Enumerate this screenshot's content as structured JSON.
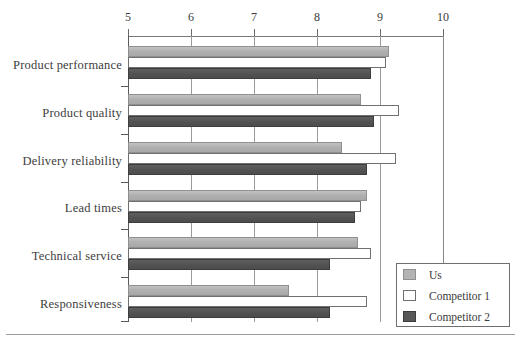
{
  "chart_data": {
    "type": "bar",
    "orientation": "horizontal",
    "title": "",
    "subtitle": "",
    "xlabel": "",
    "ylabel": "",
    "xlim": [
      5,
      10
    ],
    "xticks": [
      5,
      6,
      7,
      8,
      9,
      10
    ],
    "xtick_labels": [
      "5",
      "6",
      "7",
      "8",
      "9",
      "10"
    ],
    "grid": "vertical",
    "legend_position": "bottom-right",
    "categories": [
      "Product performance",
      "Product quality",
      "Delivery reliability",
      "Lead times",
      "Technical service",
      "Responsiveness"
    ],
    "series": [
      {
        "name": "Us",
        "color": "#b4b4b4",
        "values": [
          9.15,
          8.7,
          8.4,
          8.8,
          8.65,
          7.55
        ]
      },
      {
        "name": "Competitor 1",
        "color": "#ffffff",
        "values": [
          9.1,
          9.3,
          9.25,
          8.7,
          8.85,
          8.8
        ]
      },
      {
        "name": "Competitor 2",
        "color": "#585858",
        "values": [
          8.85,
          8.9,
          8.8,
          8.6,
          8.2,
          8.2
        ]
      }
    ]
  },
  "legend": {
    "items": [
      {
        "label": "Us",
        "swatch": "us"
      },
      {
        "label": "Competitor 1",
        "swatch": "c1"
      },
      {
        "label": "Competitor 2",
        "swatch": "c2"
      }
    ]
  },
  "axis": {
    "tick_labels": [
      "5",
      "6",
      "7",
      "8",
      "9",
      "10"
    ]
  },
  "labels": {
    "c0": "Product performance",
    "c1": "Product quality",
    "c2": "Delivery reliability",
    "c3": "Lead times",
    "c4": "Technical service",
    "c5": "Responsiveness"
  }
}
